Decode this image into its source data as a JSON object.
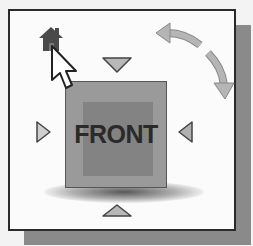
{
  "viewcube": {
    "face_label": "FRONT",
    "controls": [
      {
        "name": "home",
        "icon": "home-icon"
      },
      {
        "name": "orbit-arrows",
        "icon": "rotate-arrows-icon"
      },
      {
        "name": "view-top",
        "icon": "triangle-down-icon"
      },
      {
        "name": "view-left",
        "icon": "triangle-right-icon"
      },
      {
        "name": "view-right",
        "icon": "triangle-left-icon"
      },
      {
        "name": "view-bottom",
        "icon": "triangle-up-icon"
      }
    ],
    "cursor": "arrow-pointer"
  },
  "colors": {
    "frame_border": "#2a2a2a",
    "frame_bg": "#fbfbfb",
    "shadow": "#8a8a8a",
    "cube_face": "#9a9a9a",
    "cube_inner": "#838383",
    "triangle_fill": "#b8b8b8",
    "home_icon": "#4a4a4a"
  }
}
